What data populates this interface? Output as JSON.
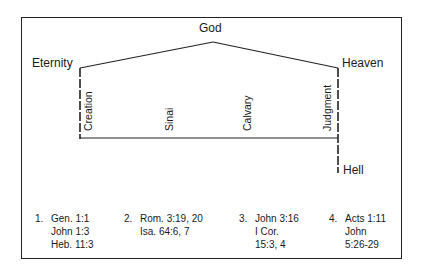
{
  "diagram": {
    "top_label": "God",
    "left_label": "Eternity",
    "right_label": "Heaven",
    "bottom_right_label": "Hell",
    "events": [
      {
        "label": "Creation"
      },
      {
        "label": "Sinai"
      },
      {
        "label": "Calvary"
      },
      {
        "label": "Judgment"
      }
    ],
    "line_color": "#222222"
  },
  "references": [
    {
      "number": "1.",
      "lines": [
        "Gen. 1:1",
        "John 1:3",
        "Heb. 11:3"
      ]
    },
    {
      "number": "2.",
      "lines": [
        "Rom. 3:19, 20",
        "Isa. 64:6, 7"
      ]
    },
    {
      "number": "3.",
      "lines": [
        "John 3:16",
        "I Cor.",
        "15:3, 4"
      ]
    },
    {
      "number": "4.",
      "lines": [
        "Acts 1:11",
        "John",
        "5:26-29"
      ]
    }
  ]
}
